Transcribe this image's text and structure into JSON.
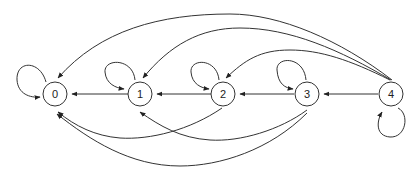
{
  "diagram": {
    "type": "state-transition-graph",
    "colors": {
      "stroke": "#333333",
      "background": "#ffffff"
    },
    "nodes": [
      {
        "id": "0",
        "label": "0"
      },
      {
        "id": "1",
        "label": "1"
      },
      {
        "id": "2",
        "label": "2"
      },
      {
        "id": "3",
        "label": "3"
      },
      {
        "id": "4",
        "label": "4"
      }
    ],
    "edges": [
      {
        "from": "0",
        "to": "0",
        "kind": "self-loop"
      },
      {
        "from": "1",
        "to": "1",
        "kind": "self-loop"
      },
      {
        "from": "2",
        "to": "2",
        "kind": "self-loop"
      },
      {
        "from": "3",
        "to": "3",
        "kind": "self-loop"
      },
      {
        "from": "4",
        "to": "4",
        "kind": "self-loop"
      },
      {
        "from": "1",
        "to": "0",
        "kind": "straight"
      },
      {
        "from": "2",
        "to": "1",
        "kind": "straight"
      },
      {
        "from": "3",
        "to": "2",
        "kind": "straight"
      },
      {
        "from": "4",
        "to": "3",
        "kind": "straight"
      },
      {
        "from": "4",
        "to": "0",
        "kind": "arc-top"
      },
      {
        "from": "4",
        "to": "1",
        "kind": "arc-top"
      },
      {
        "from": "4",
        "to": "2",
        "kind": "arc-top"
      },
      {
        "from": "2",
        "to": "0",
        "kind": "arc-bottom"
      },
      {
        "from": "3",
        "to": "1",
        "kind": "arc-bottom"
      },
      {
        "from": "3",
        "to": "0",
        "kind": "arc-bottom"
      }
    ]
  }
}
